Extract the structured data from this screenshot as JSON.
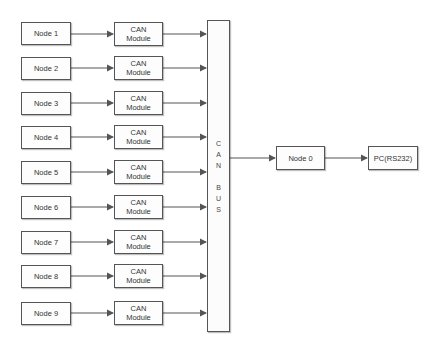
{
  "diagram": {
    "nodes": [
      {
        "label": "Node 1",
        "module": [
          "CAN",
          "Module"
        ]
      },
      {
        "label": "Node 2",
        "module": [
          "CAN",
          "Module"
        ]
      },
      {
        "label": "Node 3",
        "module": [
          "CAN",
          "Module"
        ]
      },
      {
        "label": "Node 4",
        "module": [
          "CAN",
          "Module"
        ]
      },
      {
        "label": "Node 5",
        "module": [
          "CAN",
          "Module"
        ]
      },
      {
        "label": "Node 6",
        "module": [
          "CAN",
          "Module"
        ]
      },
      {
        "label": "Node 7",
        "module": [
          "CAN",
          "Module"
        ]
      },
      {
        "label": "Node 8",
        "module": [
          "CAN",
          "Module"
        ]
      },
      {
        "label": "Node 9",
        "module": [
          "CAN",
          "Module"
        ]
      }
    ],
    "bus": {
      "letters": [
        "C",
        "A",
        "N",
        "",
        "B",
        "U",
        "S"
      ]
    },
    "master": {
      "label": "Node 0"
    },
    "pc": {
      "label": "PC(RS232)"
    },
    "colors": {
      "line": "#555555",
      "box_fill": "#fdfdfd",
      "text": "#333333"
    }
  }
}
